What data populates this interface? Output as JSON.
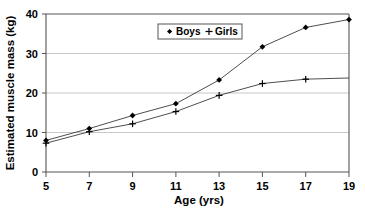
{
  "chart_data": {
    "type": "line",
    "title": "",
    "xlabel": "Age (yrs)",
    "ylabel": "Estimated muscle mass (kg)",
    "x": [
      5,
      7,
      9,
      11,
      13,
      15,
      17,
      19
    ],
    "xtick_labels": [
      "5",
      "7",
      "9",
      "11",
      "13",
      "15",
      "17",
      "19"
    ],
    "ytick_labels": [
      "0",
      "10",
      "20",
      "30",
      "40"
    ],
    "yticks": [
      0,
      10,
      20,
      30,
      40
    ],
    "xlim": [
      5,
      19
    ],
    "ylim": [
      0,
      40
    ],
    "grid": "horizontal",
    "legend_position": "top-center",
    "series": [
      {
        "name": "Boys",
        "marker": "filled-diamond",
        "values": [
          8.0,
          11.0,
          14.3,
          17.3,
          23.3,
          31.7,
          36.6,
          38.6
        ]
      },
      {
        "name": "Girls",
        "marker": "plus",
        "values": [
          7.3,
          10.2,
          12.2,
          15.3,
          19.4,
          22.4,
          23.5,
          23.8
        ],
        "last_point_marked": false
      }
    ],
    "legend": [
      {
        "label": "Boys",
        "marker": "filled-diamond"
      },
      {
        "label": "Girls",
        "marker": "plus"
      }
    ]
  },
  "axes": {
    "y_title": "Estimated muscle mass (kg)",
    "x_title": "Age (yrs)",
    "y_tick_0": "0",
    "y_tick_1": "10",
    "y_tick_2": "20",
    "y_tick_3": "30",
    "y_tick_4": "40",
    "x_tick_0": "5",
    "x_tick_1": "7",
    "x_tick_2": "9",
    "x_tick_3": "11",
    "x_tick_4": "13",
    "x_tick_5": "15",
    "x_tick_6": "17",
    "x_tick_7": "19"
  },
  "legend": {
    "boys_label": "Boys",
    "girls_label": "Girls"
  },
  "colors": {
    "line": "#3a3a3a",
    "grid": "#b0b0b0",
    "frame": "#555555",
    "text": "#000000",
    "background": "#ffffff"
  }
}
